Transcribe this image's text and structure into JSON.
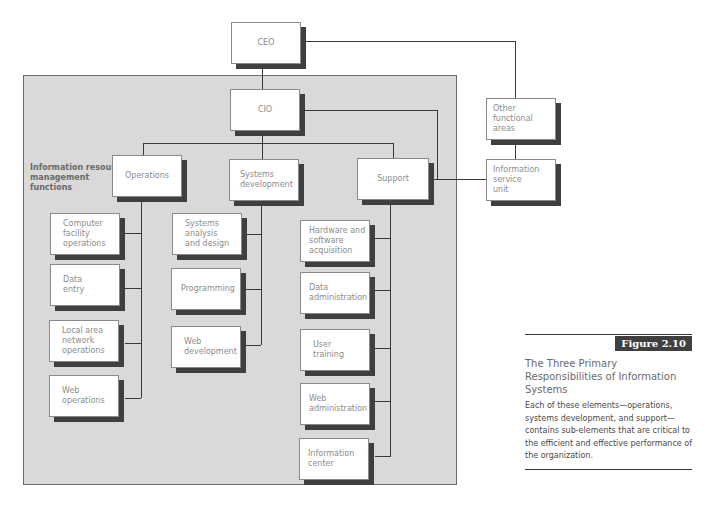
{
  "figure": {
    "tag": "Figure 2.10",
    "title": "The Three Primary Responsibilities of Information Systems",
    "description": "Each of these elements—operations, systems development, and support—contains sub-elements that are critical to the efficient and effective performance of the organization."
  },
  "region_label": "Information resource\nmanagement\nfunctions",
  "nodes": {
    "ceo": "CEO",
    "cio": "CIO",
    "other_functional_areas": "Other functional\nareas",
    "information_service_unit": "Information\nservice\nunit",
    "operations": "Operations",
    "systems_development": "Systems\ndevelopment",
    "support": "Support",
    "operations_children": [
      "Computer\nfacility\noperations",
      "Data\nentry",
      "Local area\nnetwork\noperations",
      "Web\noperations"
    ],
    "systems_development_children": [
      "Systems\nanalysis\nand design",
      "Programming",
      "Web\ndevelopment"
    ],
    "support_children": [
      "Hardware and\nsoftware\nacquisition",
      "Data\nadministration",
      "User\ntraining",
      "Web\nadministration",
      "Information\ncenter"
    ]
  },
  "colors": {
    "region_fill": "#d9d9d9",
    "shadow": "#3f3f3f",
    "node_text": "#8c8c8c",
    "figure_tag_bg": "#3f3f3f"
  }
}
